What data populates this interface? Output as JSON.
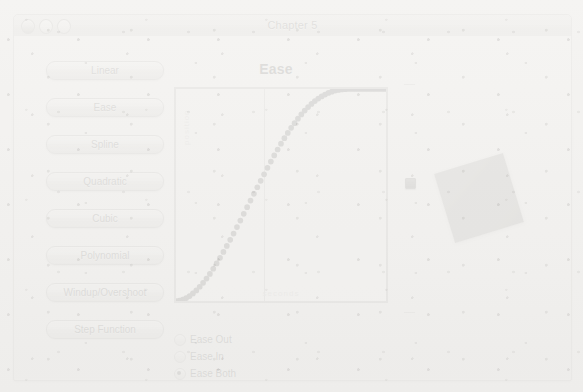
{
  "window": {
    "title": "Chapter 5",
    "traffic_lights": [
      "close",
      "minimize",
      "zoom"
    ]
  },
  "buttons": [
    {
      "label": "Linear"
    },
    {
      "label": "Ease"
    },
    {
      "label": "Spline"
    },
    {
      "label": "Quadratic"
    },
    {
      "label": "Cubic"
    },
    {
      "label": "Polynomial"
    },
    {
      "label": "Windup/Overshoot"
    },
    {
      "label": "Step Function"
    }
  ],
  "chart_data": {
    "type": "line",
    "title": "Ease",
    "xlabel": "seconds",
    "ylabel": "position",
    "xlim": [
      0,
      1
    ],
    "ylim": [
      0,
      1
    ],
    "grid": false,
    "legend": "none",
    "annotations": [
      "playhead line at x = 0.42"
    ],
    "series": [
      {
        "name": "Ease Both",
        "marker": "dotted",
        "x": [
          0.0,
          0.02,
          0.04,
          0.06,
          0.08,
          0.1,
          0.12,
          0.14,
          0.16,
          0.18,
          0.2,
          0.22,
          0.24,
          0.26,
          0.28,
          0.3,
          0.32,
          0.34,
          0.36,
          0.38,
          0.4,
          0.42,
          0.44,
          0.46,
          0.48,
          0.5,
          0.52,
          0.54,
          0.56,
          0.58,
          0.6,
          0.62,
          0.64,
          0.66,
          0.68,
          0.7,
          0.72,
          0.74,
          0.76,
          0.78,
          0.8,
          0.82,
          0.84,
          0.86,
          0.88,
          0.9,
          0.92,
          0.94,
          0.96,
          0.98,
          1.0
        ],
        "y": [
          0.0,
          0.002,
          0.009,
          0.02,
          0.035,
          0.053,
          0.075,
          0.099,
          0.126,
          0.156,
          0.187,
          0.221,
          0.256,
          0.292,
          0.329,
          0.367,
          0.406,
          0.445,
          0.484,
          0.523,
          0.561,
          0.599,
          0.637,
          0.673,
          0.708,
          0.742,
          0.774,
          0.805,
          0.833,
          0.859,
          0.884,
          0.906,
          0.925,
          0.942,
          0.957,
          0.969,
          0.979,
          0.987,
          0.993,
          0.997,
          0.999,
          1.0,
          1.0,
          1.0,
          1.0,
          1.0,
          1.0,
          1.0,
          1.0,
          1.0,
          1.0
        ]
      }
    ]
  },
  "radio_group": {
    "name": "easing-direction",
    "options": [
      {
        "label": "Ease Out",
        "selected": false
      },
      {
        "label": "Ease In",
        "selected": false
      },
      {
        "label": "Ease Both",
        "selected": true
      }
    ]
  },
  "slider": {
    "orientation": "vertical",
    "value_fraction": 0.57
  },
  "stage": {
    "object": "square",
    "rotation_degrees": -17,
    "color": "#7e7d7a"
  }
}
